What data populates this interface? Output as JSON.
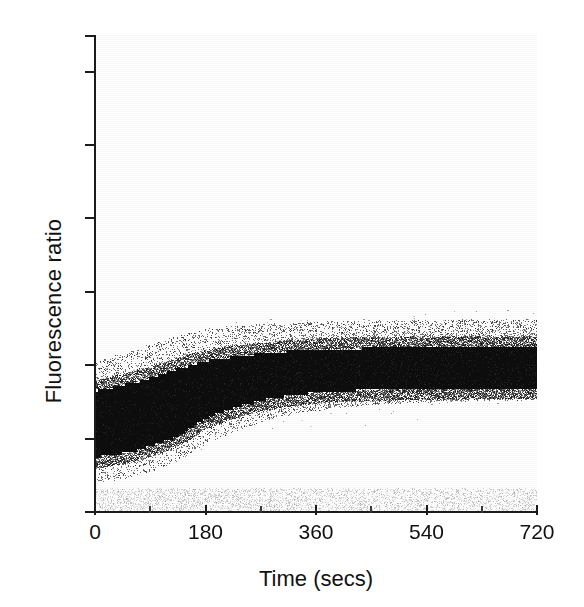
{
  "figure": {
    "title": "",
    "background": "#ffffff",
    "ink": "#1b1b1b"
  },
  "axes": {
    "ylabel": "Fluorescence ratio",
    "xlabel": "Time (secs)",
    "y_ticklabels": [
      "0",
      "10",
      "20",
      "30",
      "40",
      "50",
      "60"
    ],
    "x_ticklabels": [
      "0",
      "180",
      "360",
      "540",
      "720"
    ]
  },
  "chart_data": {
    "type": "scatter",
    "title": "",
    "xlabel": "Time (secs)",
    "ylabel": "Fluorescence ratio",
    "xlim": [
      0,
      720
    ],
    "ylim": [
      0,
      65
    ],
    "xticks": [
      0,
      180,
      360,
      540,
      720
    ],
    "xticks_minor": [
      90,
      270,
      450,
      630
    ],
    "yticks": [
      0,
      10,
      20,
      30,
      40,
      50,
      60
    ],
    "grid": false,
    "legend": null,
    "bands": {
      "x": [
        0,
        15,
        30,
        45,
        60,
        75,
        90,
        105,
        120,
        135,
        150,
        165,
        180,
        210,
        240,
        270,
        300,
        330,
        360,
        400,
        440,
        480,
        520,
        560,
        600,
        640,
        680,
        720
      ],
      "core_low": [
        7.5,
        7.6,
        7.8,
        8.0,
        8.3,
        8.6,
        9.0,
        9.4,
        9.9,
        10.5,
        11.2,
        12.0,
        12.8,
        13.8,
        14.6,
        15.2,
        15.7,
        16.0,
        16.3,
        16.5,
        16.6,
        16.7,
        16.8,
        16.8,
        16.8,
        16.9,
        16.9,
        16.9
      ],
      "core_high": [
        16.5,
        16.7,
        17.0,
        17.3,
        17.6,
        17.9,
        18.3,
        18.7,
        19.1,
        19.5,
        19.9,
        20.3,
        20.6,
        21.0,
        21.3,
        21.6,
        21.8,
        22.0,
        22.1,
        22.2,
        22.3,
        22.3,
        22.4,
        22.4,
        22.4,
        22.4,
        22.4,
        22.4
      ],
      "halo_low": [
        4.0,
        4.1,
        4.3,
        4.5,
        4.8,
        5.1,
        5.5,
        5.9,
        6.4,
        7.0,
        7.7,
        8.4,
        9.2,
        10.4,
        11.4,
        12.2,
        12.9,
        13.4,
        13.8,
        14.2,
        14.5,
        14.7,
        14.9,
        15.0,
        15.1,
        15.2,
        15.2,
        15.3
      ],
      "halo_high": [
        20.5,
        20.8,
        21.2,
        21.6,
        22.0,
        22.4,
        22.8,
        23.2,
        23.6,
        24.0,
        24.3,
        24.6,
        24.9,
        25.2,
        25.4,
        25.6,
        25.7,
        25.8,
        25.9,
        26.0,
        26.0,
        26.1,
        26.1,
        26.1,
        26.2,
        26.2,
        26.2,
        26.2
      ],
      "outlier_high": [
        36.0,
        34.0,
        32.0,
        31.0,
        30.0,
        29.5,
        29.0,
        28.8,
        28.6,
        28.5,
        28.4,
        28.3,
        28.2,
        28.1,
        28.0,
        28.0,
        27.9,
        27.9,
        27.8,
        27.8,
        27.8,
        27.7,
        27.7,
        27.7,
        27.6,
        27.6,
        27.6,
        27.6
      ],
      "outlier_low": [
        0.2,
        0.2,
        0.3,
        0.3,
        0.4,
        0.4,
        0.5,
        0.5,
        0.6,
        0.6,
        0.7,
        0.7,
        0.8,
        0.8,
        0.9,
        0.9,
        1.0,
        1.0,
        1.0,
        1.1,
        1.1,
        1.1,
        1.2,
        1.2,
        1.2,
        1.2,
        1.3,
        1.3
      ]
    },
    "notes": {
      "core_color": "#0d0d0d",
      "halo_color": "#6e6e6e",
      "outlier_color": "#9a9a9a",
      "plateau_range": [
        16.9,
        22.4
      ],
      "start_range": [
        7.5,
        16.5
      ]
    }
  }
}
